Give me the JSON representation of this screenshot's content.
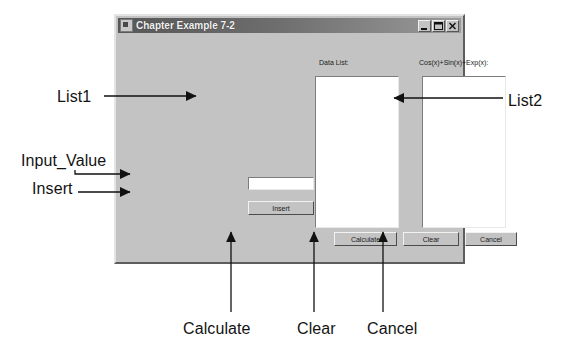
{
  "figure": {
    "annotations": [
      {
        "id": "list1",
        "label": "List1"
      },
      {
        "id": "list2",
        "label": "List2"
      },
      {
        "id": "input",
        "label": "Input_Value"
      },
      {
        "id": "insert",
        "label": "Insert"
      },
      {
        "id": "calculate",
        "label": "Calculate"
      },
      {
        "id": "clear",
        "label": "Clear"
      },
      {
        "id": "cancel",
        "label": "Cancel"
      }
    ],
    "colors": {
      "page_background": "#ffffff",
      "dialog_face": "#c3c3c3",
      "titlebar_dark": "#575757",
      "titlebar_light": "#9a9a9a",
      "titlebar_text": "#f2f2f2",
      "field_background": "#ffffff",
      "annotation_text": "#131313"
    }
  },
  "dialog": {
    "title": "Chapter Example 7-2",
    "icon": "app-window-icon",
    "window_buttons": [
      {
        "name": "minimize",
        "icon": "minimize-icon"
      },
      {
        "name": "maximize",
        "icon": "maximize-icon"
      },
      {
        "name": "close",
        "icon": "close-icon"
      }
    ],
    "labels": {
      "data_list": "Data List:",
      "expression": "Cos(x)+Sin(x)+Exp(x):"
    },
    "lists": {
      "list1_items": [],
      "list2_items": []
    },
    "input": {
      "value": "",
      "placeholder": ""
    },
    "buttons": {
      "insert": "Insert",
      "calculate": "Calculate",
      "clear": "Clear",
      "cancel": "Cancel"
    }
  }
}
